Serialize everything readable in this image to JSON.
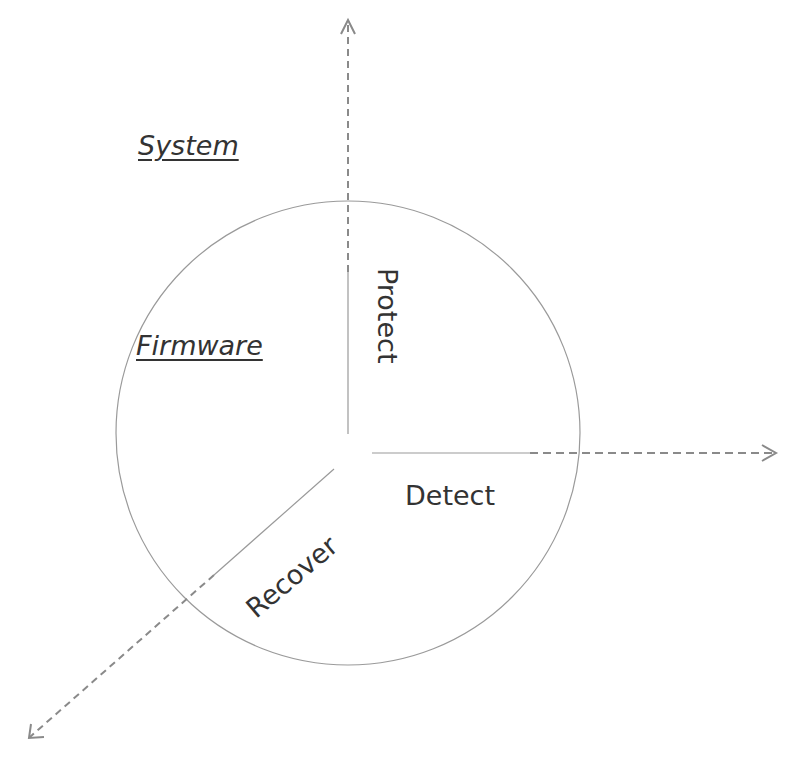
{
  "diagram": {
    "type": "radial-three-axis",
    "colors": {
      "circle": "#999999",
      "axis": "#8a8a8a",
      "text": "#333333",
      "background": "#ffffff"
    },
    "scopes": [
      {
        "id": "system",
        "label": "System"
      },
      {
        "id": "firmware",
        "label": "Firmware"
      }
    ],
    "phases": [
      {
        "id": "protect",
        "label": "Protect"
      },
      {
        "id": "detect",
        "label": "Detect"
      },
      {
        "id": "recover",
        "label": "Recover"
      }
    ],
    "axes": [
      {
        "id": "up",
        "direction": "up"
      },
      {
        "id": "right",
        "direction": "right"
      },
      {
        "id": "down-left",
        "direction": "down-left"
      }
    ]
  }
}
